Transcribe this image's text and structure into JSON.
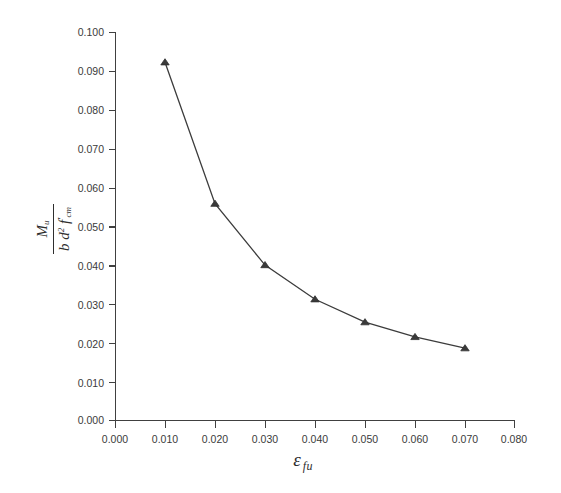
{
  "chart_data": {
    "type": "line",
    "title": "",
    "xlabel": "ε fu",
    "ylabel": "M u / ( b d² f'cm )",
    "xlim": [
      0.0,
      0.08
    ],
    "ylim": [
      0.0,
      0.1
    ],
    "grid": false,
    "legend": null,
    "marker": "triangle",
    "line_color": "#3c3c3c",
    "marker_color": "#3a3a3a",
    "x": [
      0.01,
      0.02,
      0.03,
      0.04,
      0.05,
      0.06,
      0.07
    ],
    "values": [
      0.0922,
      0.0558,
      0.04,
      0.0312,
      0.0253,
      0.0215,
      0.0186
    ],
    "xticks": [
      "0.000",
      "0.010",
      "0.020",
      "0.030",
      "0.040",
      "0.050",
      "0.060",
      "0.070",
      "0.080"
    ],
    "xtick_values": [
      0.0,
      0.01,
      0.02,
      0.03,
      0.04,
      0.05,
      0.06,
      0.07,
      0.08
    ],
    "yticks": [
      "0.000",
      "0.010",
      "0.020",
      "0.030",
      "0.040",
      "0.050",
      "0.060",
      "0.070",
      "0.080",
      "0.090",
      "0.100"
    ],
    "ytick_values": [
      0.0,
      0.01,
      0.02,
      0.03,
      0.04,
      0.05,
      0.06,
      0.07,
      0.08,
      0.09,
      0.1
    ]
  },
  "axis_titles": {
    "x_symbol": "ε",
    "x_subscript": "fu",
    "y_numerator_main": "M",
    "y_numerator_sub": "u",
    "y_denominator": "b d² f'cm",
    "y_den_b": "b",
    "y_den_d": "d",
    "y_den_d_exp": "2",
    "y_den_f": "f",
    "y_den_f_prime": "′",
    "y_den_f_sub": "cm"
  }
}
